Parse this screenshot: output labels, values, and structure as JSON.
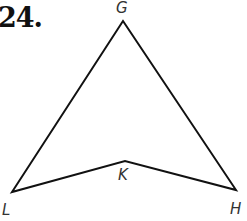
{
  "problem": {
    "number": "24."
  },
  "figure": {
    "type": "quadrilateral (concave kite / dart)",
    "vertices": [
      {
        "name": "G",
        "x": 123,
        "y": 21,
        "label": "G"
      },
      {
        "name": "H",
        "x": 236,
        "y": 190,
        "label": "H"
      },
      {
        "name": "K",
        "x": 125,
        "y": 161,
        "label": "K"
      },
      {
        "name": "L",
        "x": 12,
        "y": 192,
        "label": "L"
      }
    ],
    "edges": [
      "GH",
      "HK",
      "KL",
      "LG"
    ],
    "stroke_color": "#111111"
  }
}
